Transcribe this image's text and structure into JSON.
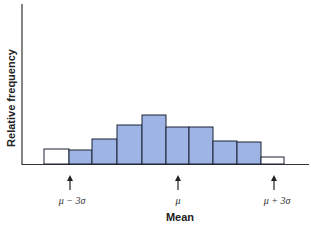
{
  "chart_data": {
    "type": "bar",
    "title": "",
    "xlabel": "Mean",
    "ylabel": "Relative frequency",
    "categories": [
      "1",
      "2",
      "3",
      "4",
      "5",
      "6",
      "7",
      "8",
      "9",
      "10"
    ],
    "values": [
      15,
      14,
      25,
      39,
      49,
      37,
      37,
      23,
      22,
      7
    ],
    "bar_fill": [
      "#ffffff",
      "#9db4e4",
      "#9db4e4",
      "#9db4e4",
      "#9db4e4",
      "#9db4e4",
      "#9db4e4",
      "#9db4e4",
      "#9db4e4",
      "#ffffff"
    ],
    "annotations": [
      {
        "label": "μ − 3σ",
        "position": "between bar 1 and bar 2"
      },
      {
        "label": "μ",
        "position": "between bar 6 center"
      },
      {
        "label": "μ + 3σ",
        "position": "between bar 10 and right end"
      }
    ],
    "grid": false,
    "legend": null
  },
  "labels": {
    "ylabel": "Relative frequency",
    "xlabel": "Mean",
    "minus3": "μ − 3σ",
    "mu": "μ",
    "plus3": "μ + 3σ"
  },
  "colors": {
    "bar_blue": "#9db4e4",
    "outline": "#1c2233"
  }
}
